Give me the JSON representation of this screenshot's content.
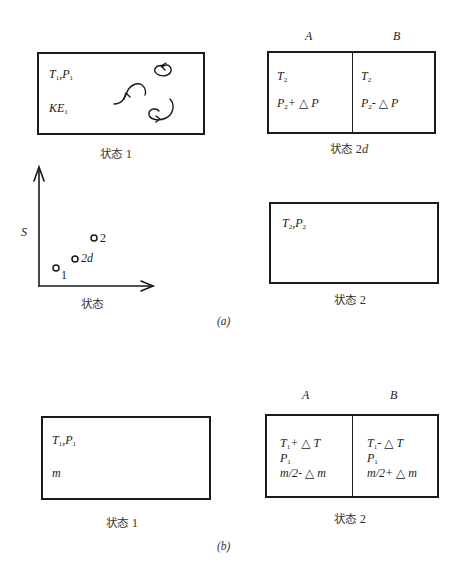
{
  "panel_a": {
    "label": "(a)",
    "state1": {
      "caption": "状态",
      "caption_num": "1",
      "line1": {
        "T": "T",
        "T_sub": "1",
        "sep": ",",
        "P": "P",
        "P_sub": "1"
      },
      "line2": {
        "KE": "KE",
        "KE_sub": "1"
      },
      "decor": "swirl-arrows (molecular motion)"
    },
    "state2d": {
      "caption": "状态",
      "caption_num": "2",
      "caption_suffix": "d",
      "left_header": "A",
      "right_header": "B",
      "left": {
        "line1": {
          "T": "T",
          "T_sub": "2"
        },
        "line2": {
          "P": "P",
          "P_sub": "2",
          "rest": "+ △ P"
        }
      },
      "right": {
        "line1": {
          "T": "T",
          "T_sub": "2"
        },
        "line2": {
          "P": "P",
          "P_sub": "2",
          "rest": "- △ P"
        }
      }
    },
    "state2": {
      "caption": "状态",
      "caption_num": "2",
      "line1": {
        "T": "T",
        "T_sub": "2",
        "sep": ",",
        "P": "P",
        "P_sub": "2"
      }
    },
    "plot": {
      "y_label": "S",
      "x_label": "状态",
      "points": [
        {
          "label": "1",
          "italic": false
        },
        {
          "label": "2d",
          "italic": true
        },
        {
          "label": "2",
          "italic": false
        }
      ]
    }
  },
  "panel_b": {
    "label": "(b)",
    "state1": {
      "caption": "状态",
      "caption_num": "1",
      "line1": {
        "T": "T",
        "T_sub": "1",
        "sep": ",",
        "P": "P",
        "P_sub": "1"
      },
      "line2": "m"
    },
    "state2": {
      "caption": "状态",
      "caption_num": "2",
      "left_header": "A",
      "right_header": "B",
      "left": {
        "line1": {
          "T": "T",
          "T_sub": "1",
          "rest": "+ △ T"
        },
        "line2": {
          "P": "P",
          "P_sub": "1"
        },
        "line3": "m/2- △ m"
      },
      "right": {
        "line1": {
          "T": "T",
          "T_sub": "1",
          "rest": "- △ T"
        },
        "line2": {
          "P": "P",
          "P_sub": "1"
        },
        "line3": "m/2+ △ m"
      }
    }
  }
}
